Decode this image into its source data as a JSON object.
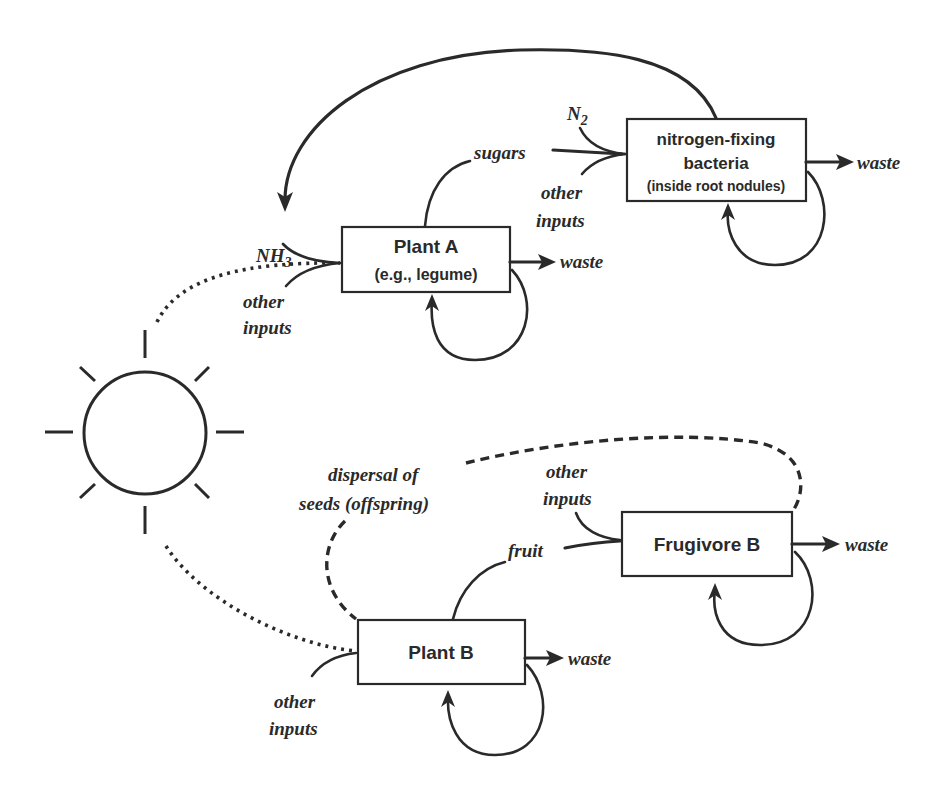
{
  "diagram": {
    "type": "energy-and-nutrient flow diagram",
    "sun": {
      "label": "",
      "icon": "sun-icon"
    },
    "nodes": {
      "plant_a": {
        "title": "Plant A",
        "subtitle": "(e.g., legume)"
      },
      "bacteria": {
        "line1": "nitrogen-fixing",
        "line2": "bacteria",
        "line3": "(inside root nodules)"
      },
      "frugivore_b": {
        "title": "Frugivore B"
      },
      "plant_b": {
        "title": "Plant B"
      }
    },
    "labels": {
      "nh3_main": "NH",
      "nh3_sub": "3",
      "n2_main": "N",
      "n2_sub": "2",
      "sugars": "sugars",
      "fruit": "fruit",
      "waste": "waste",
      "other": "other",
      "inputs": "inputs",
      "dispersal_line1": "dispersal of",
      "dispersal_line2": "seeds (offspring)"
    },
    "edges": [
      {
        "from": "sun",
        "to": "plant_a",
        "style": "dotted"
      },
      {
        "from": "sun",
        "to": "plant_b",
        "style": "dotted"
      },
      {
        "from": "bacteria",
        "to": "plant_a",
        "label": "NH3",
        "style": "solid"
      },
      {
        "from": "plant_a",
        "to": "bacteria",
        "label": "sugars",
        "style": "solid"
      },
      {
        "from": "N2",
        "to": "bacteria",
        "style": "solid"
      },
      {
        "from": "plant_b",
        "to": "frugivore_b",
        "label": "fruit",
        "style": "solid"
      },
      {
        "from": "frugivore_b",
        "to": "plant_b",
        "label": "dispersal of seeds (offspring)",
        "style": "dashed"
      },
      {
        "from": "plant_a",
        "to": "waste",
        "style": "solid"
      },
      {
        "from": "bacteria",
        "to": "waste",
        "style": "solid"
      },
      {
        "from": "frugivore_b",
        "to": "waste",
        "style": "solid"
      },
      {
        "from": "plant_b",
        "to": "waste",
        "style": "solid"
      },
      {
        "from": "plant_a",
        "to": "plant_a",
        "style": "self-loop"
      },
      {
        "from": "bacteria",
        "to": "bacteria",
        "style": "self-loop"
      },
      {
        "from": "frugivore_b",
        "to": "frugivore_b",
        "style": "self-loop"
      },
      {
        "from": "plant_b",
        "to": "plant_b",
        "style": "self-loop"
      }
    ]
  }
}
